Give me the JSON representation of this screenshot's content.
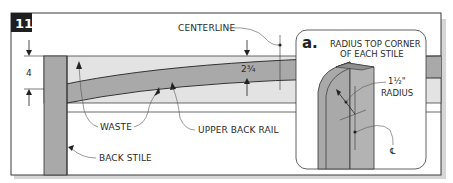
{
  "figure": {
    "step_number": "11",
    "colors": {
      "frame": "#3a3a3a",
      "step_badge": "#1f1f1f",
      "waste_fill": "#e3e3e3",
      "part_fill": "#a9a9a9",
      "shadow": "#d6d6d6",
      "leader": "#555555"
    }
  },
  "main_view": {
    "dimension_height": "4",
    "dimension_rail_width": "2¾",
    "labels": {
      "centerline": "CENTERLINE",
      "waste": "WASTE",
      "upper_back_rail": "UPPER BACK RAIL",
      "back_stile": "BACK STILE"
    }
  },
  "detail_a": {
    "letter": "a.",
    "title_line1": "RADIUS TOP CORNER",
    "title_line2": "OF EACH STILE",
    "radius_value": "1½\"",
    "radius_label": "RADIUS",
    "centerline_symbol": "℄"
  }
}
